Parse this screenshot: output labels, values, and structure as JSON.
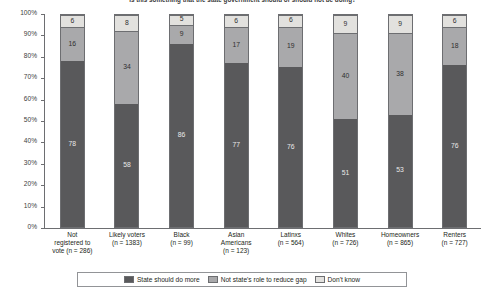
{
  "chart_data": {
    "type": "bar",
    "subtype": "stacked-bar-100-percent",
    "title": "Is this something that the state government should or should not be doing?",
    "xlabel": "",
    "ylabel": "",
    "ylim": [
      0,
      100
    ],
    "yticks": [
      "0%",
      "10%",
      "20%",
      "30%",
      "40%",
      "50%",
      "60%",
      "70%",
      "80%",
      "90%",
      "100%"
    ],
    "grid": false,
    "legend_position": "bottom",
    "categories": [
      "Not registered to vote (n = 286)",
      "Likely voters (n = 1383)",
      "Black (n = 99)",
      "Asian Americans (n = 123)",
      "Latinxs (n = 564)",
      "Whites (n = 726)",
      "Homeowners (n = 865)",
      "Renters (n = 727)"
    ],
    "category_lines": [
      [
        "Not",
        "registered to",
        "vote (n = 286)"
      ],
      [
        "Likely voters",
        "(n = 1383)"
      ],
      [
        "Black",
        "(n = 99)"
      ],
      [
        "Asian",
        "Americans",
        "(n = 123)"
      ],
      [
        "Latinxs",
        "(n = 564)"
      ],
      [
        "Whites",
        "(n = 726)"
      ],
      [
        "Homeowners",
        "(n = 865)"
      ],
      [
        "Renters",
        "(n = 727)"
      ]
    ],
    "series": [
      {
        "name": "State should do more",
        "color": "#59595b",
        "values": [
          78,
          58,
          86,
          77,
          76,
          51,
          53,
          76
        ]
      },
      {
        "name": "Not state's role to reduce gap",
        "color": "#a9a9ab",
        "values": [
          16,
          34,
          9,
          17,
          19,
          40,
          38,
          18
        ]
      },
      {
        "name": "Don't know",
        "color": "#e2e1de",
        "values": [
          6,
          8,
          5,
          6,
          6,
          9,
          9,
          6
        ]
      }
    ]
  }
}
